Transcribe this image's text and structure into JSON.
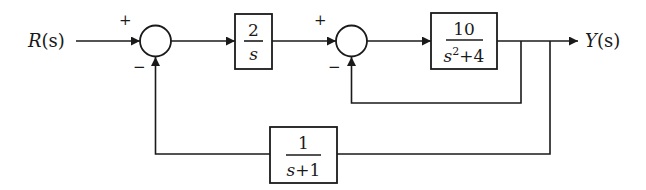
{
  "diagram": {
    "type": "control-system-block-diagram",
    "input_label": {
      "var": "R",
      "arg": "(s)"
    },
    "output_label": {
      "var": "Y",
      "arg": "(s)"
    },
    "summing_junctions": [
      {
        "id": "sum1",
        "signs": {
          "top_left": "+",
          "bottom_left": "−"
        }
      },
      {
        "id": "sum2",
        "signs": {
          "top_left": "+",
          "bottom_left": "−"
        }
      }
    ],
    "blocks": [
      {
        "id": "controller",
        "numerator": "2",
        "denominator": "s"
      },
      {
        "id": "plant",
        "numerator": "10",
        "denominator_base": "s",
        "denominator_exp": "2",
        "denominator_rest": "+4"
      },
      {
        "id": "feedback",
        "numerator": "1",
        "denominator": "s+1"
      }
    ],
    "connections": [
      "R(s) → sum1 (+)",
      "sum1 → 2/s",
      "2/s → sum2 (+)",
      "sum2 → 10/(s^2+4)",
      "10/(s^2+4) → Y(s)",
      "Y(s) branch → sum2 (−) [unity inner feedback]",
      "Y(s) branch → 1/(s+1) → sum1 (−)"
    ]
  }
}
